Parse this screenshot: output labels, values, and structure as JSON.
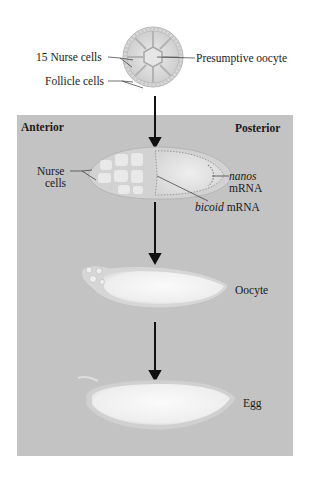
{
  "figure": {
    "stage1": {
      "labels": {
        "nurse_cells": "15 Nurse cells",
        "follicle_cells": "Follicle cells",
        "presumptive_oocyte": "Presumptive oocyte"
      }
    },
    "panel": {
      "anterior": "Anterior",
      "posterior": "Posterior",
      "background_color": "#c3c3c3"
    },
    "stage2": {
      "labels": {
        "nurse_line1": "Nurse",
        "nurse_line2": "cells",
        "nanos_italic": "nanos",
        "nanos_suffix": "mRNA",
        "bicoid_italic": "bicoid",
        "bicoid_suffix": " mRNA"
      }
    },
    "stage3": {
      "label": "Oocyte"
    },
    "stage4": {
      "label": "Egg"
    }
  }
}
